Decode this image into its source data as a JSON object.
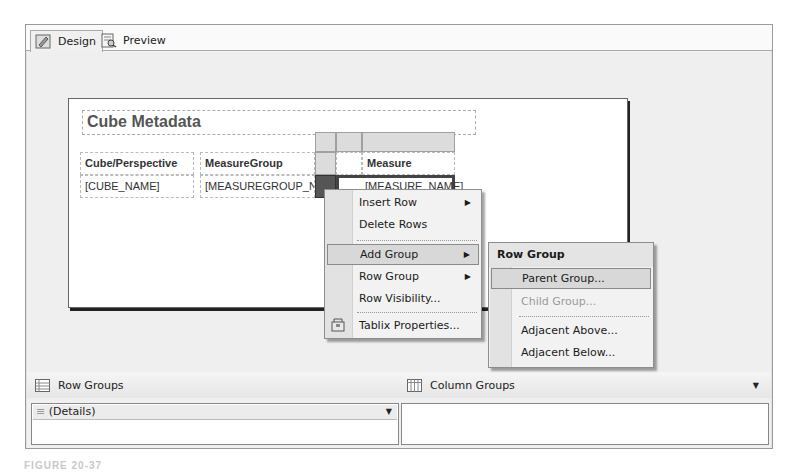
{
  "tabs": [
    {
      "label": "Design",
      "icon": "design-icon",
      "active": true
    },
    {
      "label": "Preview",
      "icon": "preview-icon",
      "active": false
    }
  ],
  "report": {
    "title": "Cube Metadata",
    "columns": [
      "Cube/Perspective",
      "MeasureGroup",
      "Measure"
    ],
    "row": [
      "[CUBE_NAME]",
      "[MEASUREGROUP_NAM",
      "[MEASURE_NAME]"
    ]
  },
  "context_menu": {
    "items": [
      {
        "label": "Insert Row",
        "submenu": true
      },
      {
        "label": "Delete Rows",
        "submenu": false
      },
      {
        "label": "Add Group",
        "submenu": true,
        "highlighted": true
      },
      {
        "label": "Row Group",
        "submenu": true
      },
      {
        "label": "Row Visibility...",
        "submenu": false
      },
      {
        "label": "Tablix Properties...",
        "submenu": false,
        "icon": "properties-icon"
      }
    ]
  },
  "submenu": {
    "header": "Row Group",
    "items": [
      {
        "label": "Parent Group...",
        "highlighted": true,
        "disabled": false
      },
      {
        "label": "Child Group...",
        "highlighted": false,
        "disabled": true
      },
      {
        "label": "Adjacent Above...",
        "highlighted": false,
        "disabled": false
      },
      {
        "label": "Adjacent Below...",
        "highlighted": false,
        "disabled": false
      }
    ]
  },
  "groups_pane": {
    "row_groups_label": "Row Groups",
    "column_groups_label": "Column Groups",
    "row_group_items": [
      "(Details)"
    ]
  },
  "caption": "FIGURE 20-37"
}
